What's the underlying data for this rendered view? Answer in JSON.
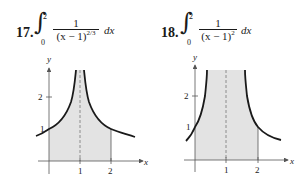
{
  "problems": [
    {
      "number": "17.",
      "integral": {
        "lower": "0",
        "upper": "2",
        "numerator": "1",
        "denominator_base": "(x − 1)",
        "denominator_exponent": "2/3",
        "differential": "dx"
      },
      "graph": {
        "x_axis_label": "x",
        "y_axis_label": "y",
        "x_ticks": [
          "1",
          "2"
        ],
        "y_ticks": [
          "1",
          "2"
        ],
        "asymptote": "x = 1",
        "shaded_interval": [
          0,
          2
        ]
      }
    },
    {
      "number": "18.",
      "integral": {
        "lower": "0",
        "upper": "2",
        "numerator": "1",
        "denominator_base": "(x − 1)",
        "denominator_exponent": "2",
        "differential": "dx"
      },
      "graph": {
        "x_axis_label": "x",
        "y_axis_label": "y",
        "x_ticks": [
          "1",
          "2"
        ],
        "y_ticks": [
          "1",
          "2"
        ],
        "asymptote": "x = 1",
        "shaded_interval": [
          0,
          2
        ]
      }
    }
  ],
  "colors": {
    "shade": "#e3e3e3",
    "curve": "#1a1a1a",
    "axis": "#555555"
  }
}
